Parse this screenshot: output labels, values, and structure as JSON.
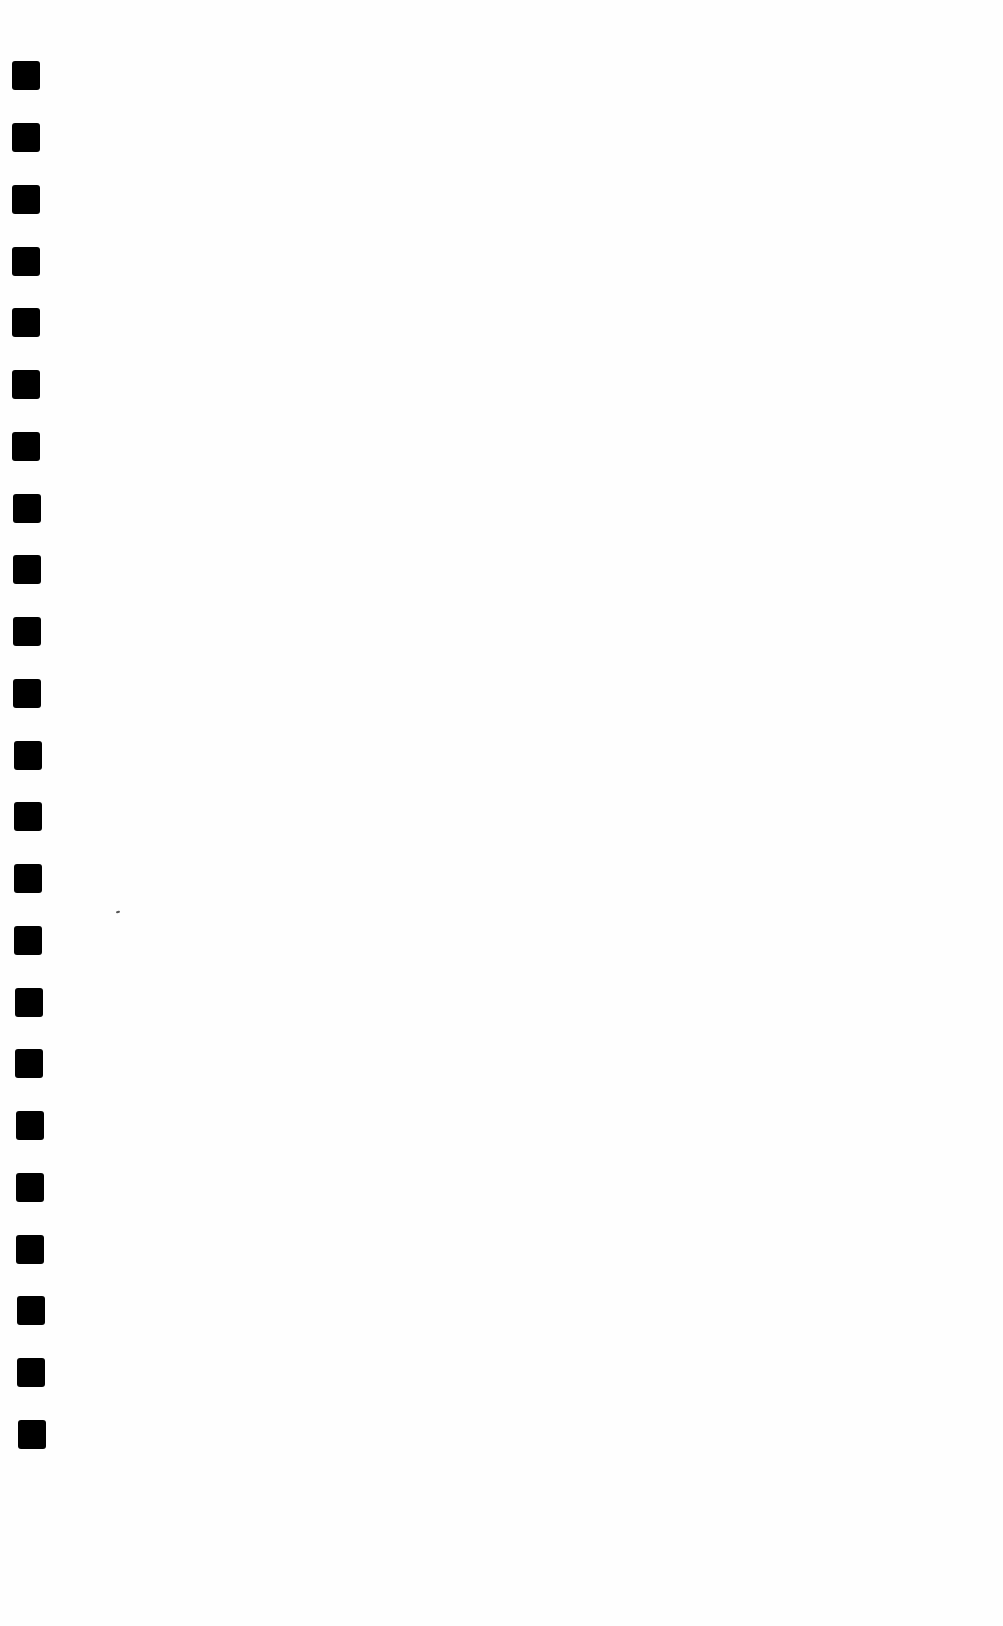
{
  "page": {
    "type": "blank scanned page",
    "background_color": "#fefefe",
    "binding_holes": {
      "count": 23,
      "color": "#000000",
      "width": 28,
      "height": 29,
      "positions": [
        {
          "x": 12,
          "y": 61
        },
        {
          "x": 12,
          "y": 123
        },
        {
          "x": 12,
          "y": 185
        },
        {
          "x": 12,
          "y": 247
        },
        {
          "x": 12,
          "y": 308
        },
        {
          "x": 12,
          "y": 370
        },
        {
          "x": 12,
          "y": 432
        },
        {
          "x": 13,
          "y": 494
        },
        {
          "x": 13,
          "y": 555
        },
        {
          "x": 13,
          "y": 617
        },
        {
          "x": 13,
          "y": 679
        },
        {
          "x": 14,
          "y": 741
        },
        {
          "x": 14,
          "y": 802
        },
        {
          "x": 14,
          "y": 864
        },
        {
          "x": 14,
          "y": 926
        },
        {
          "x": 15,
          "y": 988
        },
        {
          "x": 15,
          "y": 1049
        },
        {
          "x": 16,
          "y": 1111
        },
        {
          "x": 16,
          "y": 1173
        },
        {
          "x": 16,
          "y": 1235
        },
        {
          "x": 17,
          "y": 1296
        },
        {
          "x": 17,
          "y": 1358
        },
        {
          "x": 18,
          "y": 1420
        },
        {
          "x": 18,
          "y": 1481
        }
      ]
    },
    "specks": [
      {
        "x": 116,
        "y": 911
      }
    ]
  }
}
